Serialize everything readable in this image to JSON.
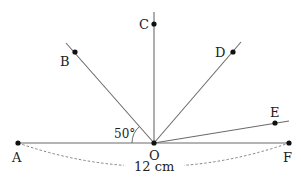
{
  "diagram": {
    "colors": {
      "line": "#6b6b6b",
      "point": "#111111",
      "text": "#222222",
      "dash": "#777777"
    },
    "points": {
      "O": {
        "label": "O"
      },
      "A": {
        "label": "A"
      },
      "B": {
        "label": "B"
      },
      "C": {
        "label": "C"
      },
      "D": {
        "label": "D"
      },
      "E": {
        "label": "E"
      },
      "F": {
        "label": "F"
      }
    },
    "angle_label": "50°",
    "length_label": "12 cm"
  }
}
